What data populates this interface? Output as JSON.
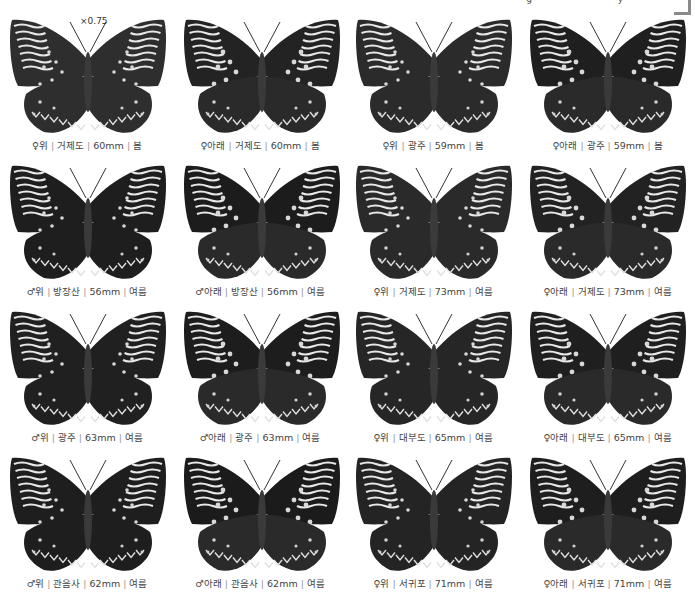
{
  "page": {
    "top_fragment": "· ·  · · ·   ·  g   · ·  ·  ·  y  ·   ·",
    "scale_note": "×0.75"
  },
  "specimens": [
    {
      "sex": "♀",
      "side": "위",
      "locality": "거제도",
      "size": "60mm",
      "season": "봄",
      "tone": "#2e2e2e",
      "underside": false
    },
    {
      "sex": "♀",
      "side": "아래",
      "locality": "거제도",
      "size": "60mm",
      "season": "봄",
      "tone": "#232323",
      "underside": true
    },
    {
      "sex": "♀",
      "side": "위",
      "locality": "광주",
      "size": "59mm",
      "season": "봄",
      "tone": "#2b2b2b",
      "underside": false
    },
    {
      "sex": "♀",
      "side": "아래",
      "locality": "광주",
      "size": "59mm",
      "season": "봄",
      "tone": "#1f1f1f",
      "underside": true
    },
    {
      "sex": "♂",
      "side": "위",
      "locality": "방장산",
      "size": "56mm",
      "season": "여름",
      "tone": "#1e1e1e",
      "underside": false
    },
    {
      "sex": "♂",
      "side": "아래",
      "locality": "방장산",
      "size": "56mm",
      "season": "여름",
      "tone": "#1c1c1c",
      "underside": true
    },
    {
      "sex": "♀",
      "side": "위",
      "locality": "거제도",
      "size": "73mm",
      "season": "여름",
      "tone": "#2a2a2a",
      "underside": false
    },
    {
      "sex": "♀",
      "side": "아래",
      "locality": "거제도",
      "size": "73mm",
      "season": "여름",
      "tone": "#222222",
      "underside": true
    },
    {
      "sex": "♂",
      "side": "위",
      "locality": "광주",
      "size": "63mm",
      "season": "여름",
      "tone": "#202020",
      "underside": false
    },
    {
      "sex": "♂",
      "side": "아래",
      "locality": "광주",
      "size": "63mm",
      "season": "여름",
      "tone": "#1d1d1d",
      "underside": true
    },
    {
      "sex": "♀",
      "side": "위",
      "locality": "대부도",
      "size": "65mm",
      "season": "여름",
      "tone": "#262626",
      "underside": false
    },
    {
      "sex": "♀",
      "side": "아래",
      "locality": "대부도",
      "size": "65mm",
      "season": "여름",
      "tone": "#1f1f1f",
      "underside": true
    },
    {
      "sex": "♂",
      "side": "위",
      "locality": "관음사",
      "size": "62mm",
      "season": "여름",
      "tone": "#1e1e1e",
      "underside": false
    },
    {
      "sex": "♂",
      "side": "아래",
      "locality": "관음사",
      "size": "62mm",
      "season": "여름",
      "tone": "#1b1b1b",
      "underside": true
    },
    {
      "sex": "♀",
      "side": "위",
      "locality": "서귀포",
      "size": "71mm",
      "season": "여름",
      "tone": "#242424",
      "underside": false
    },
    {
      "sex": "♀",
      "side": "아래",
      "locality": "서귀포",
      "size": "71mm",
      "season": "여름",
      "tone": "#1e1e1e",
      "underside": true
    }
  ]
}
